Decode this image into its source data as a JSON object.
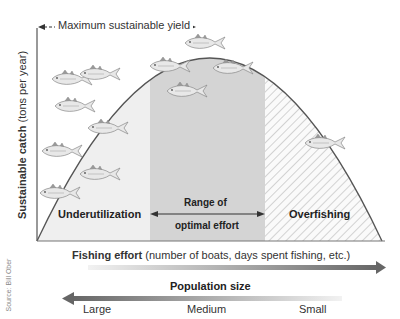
{
  "diagram": {
    "top_annotation": "Maximum sustainable yield",
    "y_axis_label_bold": "Sustainable catch",
    "y_axis_label_rest": "(tons per year)",
    "regions": {
      "left": "Underutilization",
      "middle_line1": "Range of",
      "middle_line2": "optimal effort",
      "right": "Overfishing"
    },
    "x_axis_label_bold": "Fishing effort",
    "x_axis_label_rest": "(number of boats, days spent fishing, etc.)",
    "population_title": "Population size",
    "population_ticks": [
      "Large",
      "Medium",
      "Small"
    ],
    "source": "Source: Bill Ober",
    "colors": {
      "optimal_fill": "#d4d4d4",
      "under_fill": "#efefef",
      "curve": "#555555",
      "arrow_dark": "#666666"
    }
  }
}
